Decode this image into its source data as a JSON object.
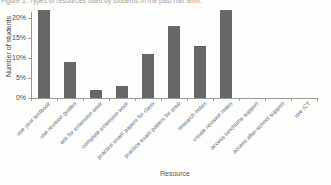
{
  "chart_data": {
    "type": "bar",
    "title": "Figure 1: Types of resources used by students in the past half term.",
    "xlabel": "Resource",
    "ylabel": "Number of students",
    "categories": [
      "use your textbook",
      "use revision guides",
      "ask for extension work",
      "complete extension work",
      "practice exam papers for class",
      "practice exam papers for prep",
      "research notes",
      "create revision notes",
      "access lunchtime support",
      "access after-school support",
      "use ICT"
    ],
    "values": [
      22,
      9,
      2,
      3,
      11,
      18,
      13,
      22,
      0,
      0,
      0
    ],
    "yticks": {
      "values": [
        0,
        5,
        10,
        15,
        20
      ],
      "labels": [
        "0%",
        "5%",
        "10%",
        "15%",
        "20%"
      ]
    },
    "ylim": [
      0,
      22.5
    ],
    "grid": false,
    "legend": "none",
    "bar_color": "#676767",
    "axis_color": "#999999"
  }
}
